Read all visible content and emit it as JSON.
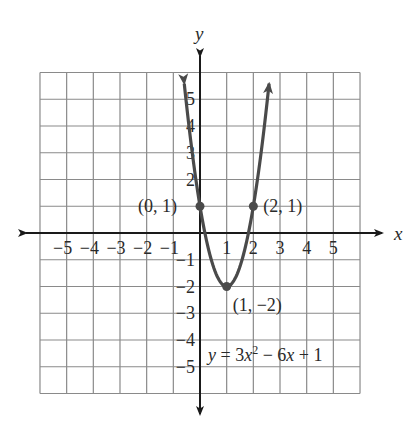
{
  "chart_data": {
    "type": "line",
    "title": "",
    "equation": {
      "text_parts": [
        "y",
        " = 3",
        "x",
        "2",
        " − 6",
        "x",
        " + 1"
      ],
      "display": "y = 3x² − 6x + 1",
      "a": 3,
      "b": -6,
      "c": 1
    },
    "xlabel": "x",
    "ylabel": "y",
    "xlim": [
      -6,
      6
    ],
    "ylim": [
      -6,
      6
    ],
    "grid": true,
    "x_ticks": [
      -5,
      -4,
      -3,
      -2,
      -1,
      1,
      2,
      3,
      4,
      5
    ],
    "y_ticks": [
      5,
      4,
      3,
      2,
      -1,
      -2,
      -3,
      -4,
      -5
    ],
    "x_tick_labels": [
      "−5",
      "−4",
      "−3",
      "−2",
      "−1",
      "1",
      "2",
      "3",
      "4",
      "5"
    ],
    "y_tick_labels": [
      "5",
      "4",
      "3",
      "2",
      "−1",
      "−2",
      "−3",
      "−4",
      "−5"
    ],
    "series": [
      {
        "name": "y = 3x² − 6x + 1",
        "x": [
          -0.59,
          -0.5,
          -0.25,
          0,
          0.25,
          0.5,
          0.75,
          1,
          1.25,
          1.5,
          1.75,
          2,
          2.25,
          2.5,
          2.59
        ],
        "y": [
          5.59,
          4.75,
          2.69,
          1,
          -0.31,
          -1.25,
          -1.81,
          -2,
          -1.81,
          -1.25,
          -0.31,
          1,
          2.69,
          4.75,
          5.59
        ]
      }
    ],
    "points": [
      {
        "x": 0,
        "y": 1,
        "label": "(0, 1)"
      },
      {
        "x": 2,
        "y": 1,
        "label": "(2, 1)"
      },
      {
        "x": 1,
        "y": -2,
        "label": "(1, −2)"
      }
    ]
  },
  "colors": {
    "grid": "#8a8a8a",
    "axis": "#1a1a1a",
    "curve": "#4a4a4a",
    "text": "#2a2a2a"
  }
}
